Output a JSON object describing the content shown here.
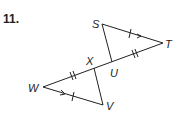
{
  "problem": {
    "number": "11."
  },
  "diagram": {
    "points": {
      "S": {
        "label": "S",
        "x": 102,
        "y": 24
      },
      "T": {
        "label": "T",
        "x": 163,
        "y": 43
      },
      "W": {
        "label": "W",
        "x": 43,
        "y": 87
      },
      "V": {
        "label": "V",
        "x": 103,
        "y": 105
      },
      "X": {
        "label": "X",
        "x": 94,
        "y": 68
      },
      "U": {
        "label": "U",
        "x": 112,
        "y": 62
      }
    },
    "segments": [
      "ST",
      "SU",
      "WT",
      "WV",
      "XV"
    ],
    "markings": {
      "ST": "single tick + arrow",
      "WV": "single tick + arrow",
      "UT": "double tick",
      "WX": "double tick"
    },
    "colors": {
      "stroke": "#222222"
    }
  }
}
